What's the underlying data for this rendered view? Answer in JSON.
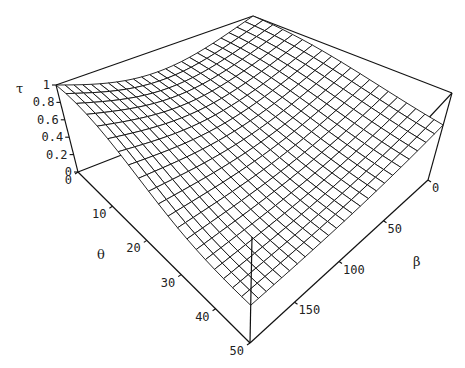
{
  "chart_data": {
    "type": "surface",
    "title": "",
    "axes": {
      "z": {
        "label": "τ",
        "range": [
          0,
          1
        ],
        "ticks": [
          "0",
          "0.2",
          "0.4",
          "0.6",
          "0.8",
          "1"
        ]
      },
      "x": {
        "label": "θ",
        "range": [
          0,
          50
        ],
        "ticks": [
          "0",
          "10",
          "20",
          "30",
          "40",
          "50"
        ]
      },
      "y": {
        "label": "β",
        "range": [
          0,
          200
        ],
        "ticks": [
          "0",
          "50",
          "100",
          "150"
        ]
      }
    },
    "grid": {
      "theta_steps": 20,
      "beta_steps": 24
    },
    "surface_description": "τ≈1 along θ=0 at both β ends with a shallow dip (~0.75) in between; τ decreases with θ, more slowly near β=0; front corner (θ=50, β=200) τ≈0.25",
    "sample_values": [
      {
        "theta": 0,
        "beta": 0,
        "tau": 1.0
      },
      {
        "theta": 0,
        "beta": 100,
        "tau": 0.75
      },
      {
        "theta": 0,
        "beta": 200,
        "tau": 1.0
      },
      {
        "theta": 50,
        "beta": 0,
        "tau": 0.45
      },
      {
        "theta": 50,
        "beta": 200,
        "tau": 0.25
      }
    ]
  },
  "labels": {
    "tau": "τ",
    "theta": "θ",
    "beta": "β"
  }
}
